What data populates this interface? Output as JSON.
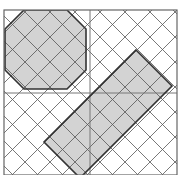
{
  "diagram": {
    "type": "geometric-tiling",
    "frame": {
      "x": 4,
      "y": 10,
      "width": 173,
      "height": 165,
      "stroke": "#666666"
    },
    "midlines": {
      "vertical_x": 90,
      "horizontal_y": 93,
      "stroke": "#777777"
    },
    "hatching": {
      "stroke": "#555555",
      "spacing": 25,
      "directions": [
        "diagonal-down",
        "diagonal-up"
      ]
    },
    "shapes": [
      {
        "name": "octagon",
        "fill": "#d3d3d3",
        "stroke": "#333333",
        "points": "24,10 67,10 86,29 86,70 67,89 24,89 5,70 5,29"
      },
      {
        "name": "rotated-rectangle",
        "fill": "#d3d3d3",
        "stroke": "#333333",
        "points": "136,50 172,86 80,178 44,142"
      }
    ]
  }
}
